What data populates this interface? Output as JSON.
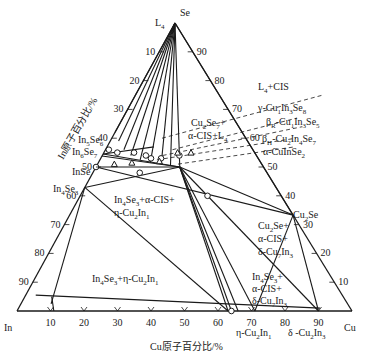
{
  "diagram": {
    "type": "ternary-phase-diagram",
    "corners": {
      "left": "In",
      "right": "Cu",
      "top": "Se"
    },
    "axis_titles": {
      "bottom": "Cu原子百分比/%",
      "left": "In原子百分比/%"
    },
    "ticks": {
      "bottom": [
        "10",
        "20",
        "30",
        "40",
        "50",
        "60",
        "70",
        "80",
        "90"
      ],
      "left": [
        "10",
        "20",
        "30",
        "40",
        "50",
        "60",
        "70",
        "80",
        "90"
      ],
      "right": [
        "90",
        "80",
        "70",
        "60",
        "50",
        "40",
        "30",
        "20",
        "10"
      ]
    },
    "phases": [
      {
        "id": "L4",
        "label": "L4",
        "cu": 0,
        "se": 100
      },
      {
        "id": "In5Se6",
        "label": "In5Se6",
        "cu": 0,
        "se": 54.5
      },
      {
        "id": "In6Se7",
        "label": "In6Se7",
        "cu": 0,
        "se": 53.8
      },
      {
        "id": "InSe",
        "label": "InSe",
        "cu": 0,
        "se": 50
      },
      {
        "id": "In4Se3",
        "label": "In4Se3",
        "cu": 0,
        "se": 42.9
      },
      {
        "id": "Cu2Se",
        "label": "Cu2Se",
        "cu": 66.7,
        "se": 33.3
      },
      {
        "id": "CIS",
        "label": "α-CuInSe2",
        "cu": 25,
        "se": 50
      }
    ],
    "region_labels": [
      {
        "text": "L4+CIS"
      },
      {
        "text": "γ-Cu1In3Se8"
      },
      {
        "text": "βR-Cu1In3Se5"
      },
      {
        "text": "βH-Cu2In4Se7"
      },
      {
        "text": "α-CuInSe2"
      },
      {
        "text": "Cu2Se7+"
      },
      {
        "text": "α-CIS+L4"
      },
      {
        "text": "In4Se3+α-CIS+"
      },
      {
        "text": "η-Cu2In1"
      },
      {
        "text": "In4Se3+η-Cu2In1"
      },
      {
        "text": "Cu2Se+"
      },
      {
        "text": "α-CIS+"
      },
      {
        "text": "δ-Cu7In3"
      },
      {
        "text": "In4Se3+"
      },
      {
        "text": "α-CIS+"
      },
      {
        "text": "δ-Cu7In3"
      }
    ],
    "bottom_phase_labels": [
      "η-Cu2In1",
      "δ -Cu2In3"
    ],
    "corner_labels": {
      "In": "In",
      "Cu": "Cu",
      "Se": "Se",
      "L4": "L4",
      "Cu2Se": "Cu2Se",
      "InSe": "InSe",
      "In4Se3": "In4Se3",
      "In5Se6": "In5Se6",
      "In6Se7": "In6Se7"
    }
  }
}
